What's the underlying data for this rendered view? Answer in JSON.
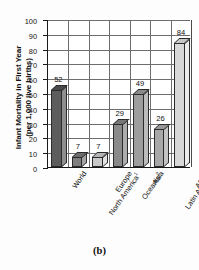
{
  "figure": {
    "caption": "(b)",
    "axis_title_line1": "Infant Mortality in First Year",
    "axis_title_line2": "(per 1,000 live births)"
  },
  "chart_data": {
    "type": "bar",
    "title": "",
    "xlabel": "",
    "ylabel": "Infant Mortality in First Year (per 1,000 live births)",
    "ylim": [
      0,
      100
    ],
    "yticks": [
      0,
      10,
      20,
      30,
      40,
      50,
      60,
      70,
      80,
      90,
      100
    ],
    "grid": true,
    "legend": "none",
    "categories": [
      "World",
      "North America¹",
      "Europe",
      "Oceania²",
      "Asia",
      "Latin America and the Caribbean",
      "Africa"
    ],
    "category_lines": [
      [
        "World"
      ],
      [
        "North America¹"
      ],
      [
        "Europe"
      ],
      [
        "Oceania²"
      ],
      [
        "Asia"
      ],
      [
        "Latin America",
        "and the",
        "Caribbean"
      ],
      [
        "Africa"
      ]
    ],
    "values": [
      52,
      7,
      7,
      29,
      49,
      26,
      84
    ],
    "value_labels": [
      "52",
      "7",
      "7",
      "29",
      "49",
      "26",
      "84"
    ],
    "bar_colors": [
      "#5d5d5d",
      "#7f7f7f",
      "#c9c9c9",
      "#8a8a8a",
      "#9d9d9d",
      "#a8a8a8",
      "#d8d8d8"
    ],
    "bar_side_colors": [
      "#8f8f8f",
      "#a5a5a5",
      "#e2e2e2",
      "#adadad",
      "#bcbcbc",
      "#c4c4c4",
      "#ececec"
    ],
    "bar_top_colors": [
      "#4a4a4a",
      "#6d6d6d",
      "#b6b6b6",
      "#777777",
      "#8b8b8b",
      "#969696",
      "#c6c6c6"
    ]
  }
}
